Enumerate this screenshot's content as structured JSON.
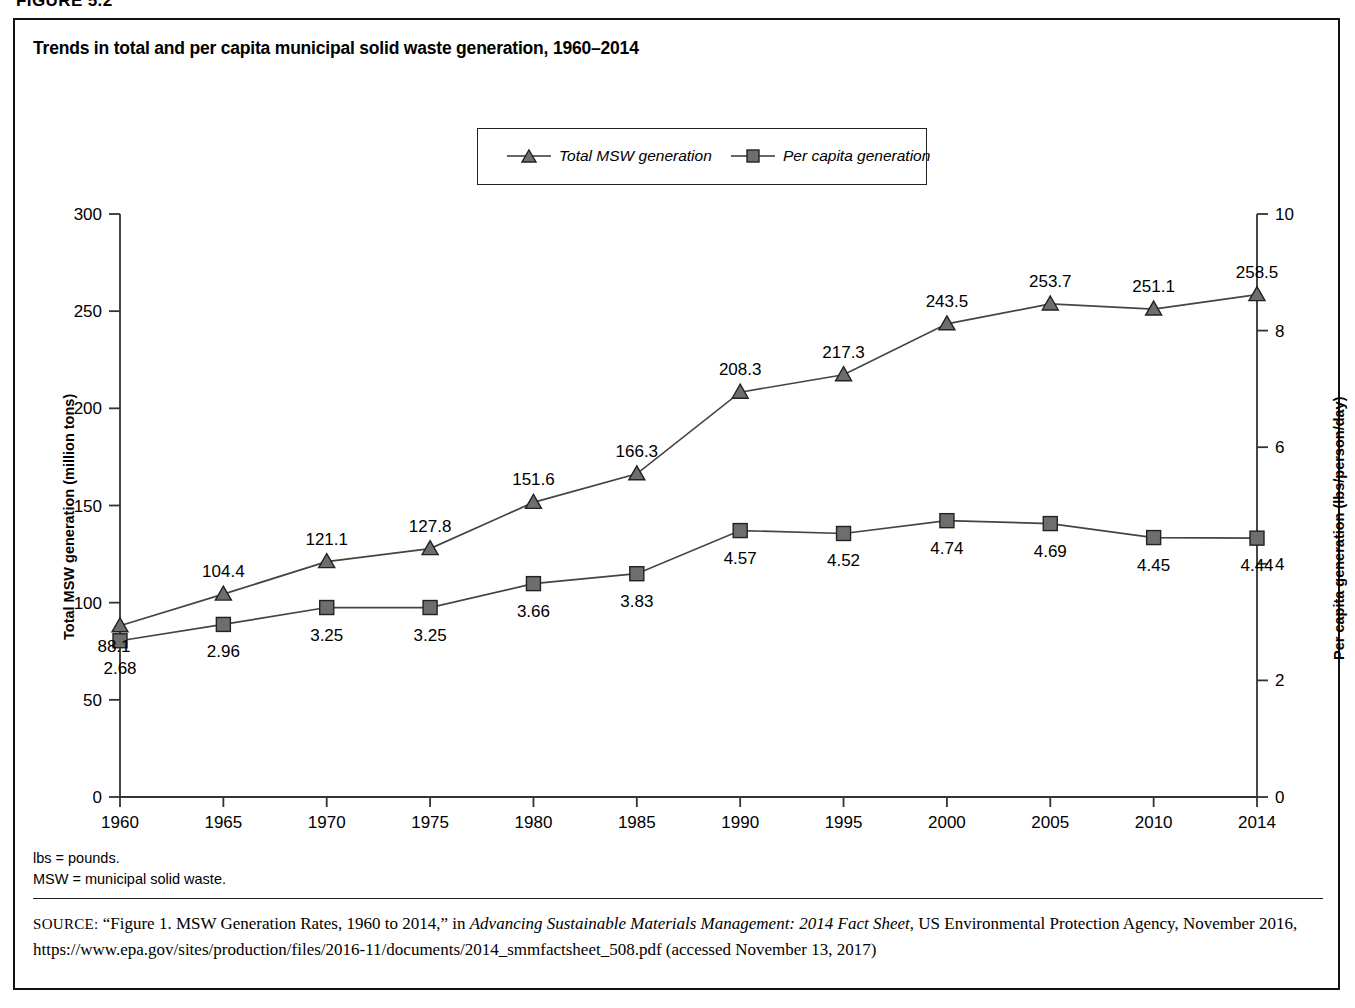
{
  "figure": {
    "number_label": "FIGURE 5.2",
    "title": "Trends in total and per capita municipal solid waste generation, 1960–2014"
  },
  "legend": {
    "items": [
      {
        "label": "Total MSW generation",
        "marker": "triangle-marker",
        "color": "#6e6e6e"
      },
      {
        "label": "Per capita generation",
        "marker": "square-marker",
        "color": "#6e6e6e"
      }
    ]
  },
  "axes": {
    "y_left_title": "Total MSW generation (million tons)",
    "y_right_title": "Per capita generation (lbs/person/day)",
    "y_left_ticks": [
      "0",
      "50",
      "100",
      "150",
      "200",
      "250",
      "300"
    ],
    "y_right_ticks": [
      "0",
      "2",
      "4",
      "6",
      "8",
      "10"
    ],
    "x_ticks": [
      "1960",
      "1965",
      "1970",
      "1975",
      "1980",
      "1985",
      "1990",
      "1995",
      "2000",
      "2005",
      "2010",
      "2014"
    ]
  },
  "notes": {
    "line1": "lbs = pounds.",
    "line2": "MSW = municipal solid waste."
  },
  "source": {
    "label": "SOURCE:",
    "text_before_italic": " “Figure 1. MSW Generation Rates, 1960 to 2014,” in ",
    "italic_title": "Advancing Sustainable Materials Management: 2014 Fact Sheet",
    "text_after_italic": ", US Environmental Protection Agency, November 2016, https://www.epa.gov/sites/production/files/2016-11/documents/2014_smmfactsheet_508.pdf (accessed November 13, 2017)"
  },
  "chart_data": {
    "type": "line",
    "title": "Trends in total and per capita municipal solid waste generation, 1960–2014",
    "xlabel": "",
    "x": [
      1960,
      1965,
      1970,
      1975,
      1980,
      1985,
      1990,
      1995,
      2000,
      2005,
      2010,
      2014
    ],
    "xtick_labels": [
      "1960",
      "1965",
      "1970",
      "1975",
      "1980",
      "1985",
      "1990",
      "1995",
      "2000",
      "2005",
      "2010",
      "2014"
    ],
    "grid": false,
    "legend_position": "top-center",
    "series": [
      {
        "name": "Total MSW generation",
        "axis": "left",
        "ylabel": "Total MSW generation (million tons)",
        "ylim": [
          0,
          300
        ],
        "marker": "triangle",
        "values": [
          88.1,
          104.4,
          121.1,
          127.8,
          151.6,
          166.3,
          208.3,
          217.3,
          243.5,
          253.7,
          251.1,
          258.5
        ],
        "data_labels": [
          "88.1",
          "104.4",
          "121.1",
          "127.8",
          "151.6",
          "166.3",
          "208.3",
          "217.3",
          "243.5",
          "253.7",
          "251.1",
          "258.5"
        ]
      },
      {
        "name": "Per capita generation",
        "axis": "right",
        "ylabel": "Per capita generation (lbs/person/day)",
        "ylim": [
          0,
          10
        ],
        "marker": "square",
        "values": [
          2.68,
          2.96,
          3.25,
          3.25,
          3.66,
          3.83,
          4.57,
          4.52,
          4.74,
          4.69,
          4.45,
          4.44
        ],
        "data_labels": [
          "2.68",
          "2.96",
          "3.25",
          "3.25",
          "3.66",
          "3.83",
          "4.57",
          "4.52",
          "4.74",
          "4.69",
          "4.45",
          "4.44"
        ]
      }
    ]
  }
}
